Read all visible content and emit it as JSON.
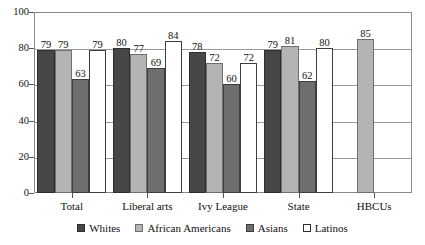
{
  "chart_data": {
    "type": "bar",
    "title": "",
    "subtitle": "",
    "xlabel": "",
    "ylabel": "",
    "ylim": [
      0,
      100
    ],
    "yticks": [
      0,
      20,
      40,
      60,
      80,
      100
    ],
    "grid": true,
    "legend_position": "bottom",
    "categories": [
      "Total",
      "Liberal arts",
      "Ivy League",
      "State",
      "HBCUs"
    ],
    "series": [
      {
        "name": "Whites",
        "color": "#474747",
        "values": [
          79,
          80,
          78,
          79,
          null
        ]
      },
      {
        "name": "African Americans",
        "color": "#b4b4b4",
        "values": [
          79,
          77,
          72,
          81,
          85
        ]
      },
      {
        "name": "Asians",
        "color": "#6e6e6e",
        "values": [
          63,
          69,
          60,
          62,
          null
        ]
      },
      {
        "name": "Latinos",
        "color": "#ffffff",
        "values": [
          79,
          84,
          72,
          80,
          null
        ]
      }
    ],
    "value_labels": {
      "Total": {
        "Whites": "79",
        "African Americans": "79",
        "Asians": "63",
        "Latinos": "79"
      },
      "Liberal arts": {
        "Whites": "80",
        "African Americans": "77",
        "Asians": "69",
        "Latinos": "84"
      },
      "Ivy League": {
        "Whites": "78",
        "African Americans": "72",
        "Asians": "60",
        "Latinos": "72"
      },
      "State": {
        "Whites": "79",
        "African Americans": "81",
        "Asians": "62",
        "Latinos": "80"
      },
      "HBCUs": {
        "African Americans": "85"
      }
    },
    "ytick_labels": [
      "0",
      "20",
      "40",
      "60",
      "80",
      "100"
    ],
    "legend": [
      "Whites",
      "African Americans",
      "Asians",
      "Latinos"
    ]
  }
}
